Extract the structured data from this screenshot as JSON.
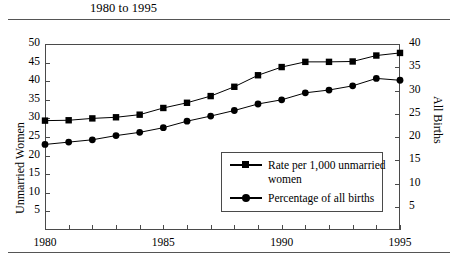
{
  "title": "1980 to 1995",
  "axes": {
    "left_title": "Unmarried Women",
    "right_title": "All Births",
    "left_ticks": [
      "50",
      "45",
      "40",
      "35",
      "30",
      "25",
      "20",
      "15",
      "10",
      "5"
    ],
    "right_ticks": [
      "40",
      "35",
      "30",
      "25",
      "20",
      "15",
      "10",
      "5"
    ],
    "x_ticks": [
      "1980",
      "1985",
      "1990",
      "1995"
    ]
  },
  "legend": {
    "items": [
      {
        "marker": "square",
        "label_line1": "Rate per 1,000 unmarried",
        "label_line2": "women"
      },
      {
        "marker": "circle",
        "label_line1": "Percentage of all births",
        "label_line2": ""
      }
    ]
  },
  "chart_data": {
    "type": "line",
    "title": "1980 to 1995",
    "xlabel": "",
    "ylabel": "Unmarried Women",
    "y2label": "All Births",
    "xlim": [
      1980,
      1995
    ],
    "ylim": [
      0,
      50
    ],
    "y2lim": [
      0,
      40
    ],
    "grid": false,
    "legend_position": "inside-bottom-right",
    "x": [
      1980,
      1981,
      1982,
      1983,
      1984,
      1985,
      1986,
      1987,
      1988,
      1989,
      1990,
      1991,
      1992,
      1993,
      1994,
      1995
    ],
    "series": [
      {
        "name": "Rate per 1,000 unmarried women",
        "marker": "square",
        "axis": "left",
        "values": [
          29.4,
          29.5,
          30.0,
          30.3,
          31.0,
          32.8,
          34.2,
          36.0,
          38.5,
          41.6,
          43.8,
          45.2,
          45.2,
          45.3,
          46.9,
          47.6
        ]
      },
      {
        "name": "Percentage of all births",
        "marker": "circle",
        "axis": "right",
        "values": [
          18.4,
          18.9,
          19.4,
          20.3,
          21.0,
          22.0,
          23.4,
          24.5,
          25.7,
          27.1,
          28.0,
          29.5,
          30.1,
          31.0,
          32.6,
          32.2
        ]
      }
    ]
  }
}
